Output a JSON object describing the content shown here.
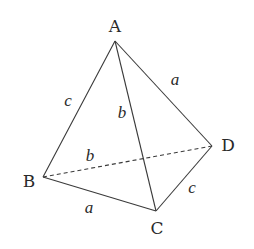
{
  "diagram": {
    "type": "tetrahedron",
    "vertices": {
      "A": {
        "label": "A",
        "x": 115,
        "y": 41,
        "lx": 115,
        "ly": 27
      },
      "B": {
        "label": "B",
        "x": 43,
        "y": 177,
        "lx": 29,
        "ly": 182
      },
      "C": {
        "label": "C",
        "x": 156,
        "y": 211,
        "lx": 157,
        "ly": 229
      },
      "D": {
        "label": "D",
        "x": 212,
        "y": 146,
        "lx": 228,
        "ly": 146
      }
    },
    "edges": [
      {
        "from": "A",
        "to": "B",
        "label": "c",
        "lx": 68,
        "ly": 102,
        "hidden": false
      },
      {
        "from": "A",
        "to": "C",
        "label": "b",
        "lx": 122,
        "ly": 114,
        "hidden": false
      },
      {
        "from": "A",
        "to": "D",
        "label": "a",
        "lx": 175,
        "ly": 81,
        "hidden": false
      },
      {
        "from": "B",
        "to": "D",
        "label": "b",
        "lx": 90,
        "ly": 157,
        "hidden": true
      },
      {
        "from": "B",
        "to": "C",
        "label": "a",
        "lx": 89,
        "ly": 209,
        "hidden": false
      },
      {
        "from": "C",
        "to": "D",
        "label": "c",
        "lx": 192,
        "ly": 189,
        "hidden": false
      }
    ],
    "colors": {
      "line": "#3a3a3a",
      "text": "#2a2a2a",
      "background": "#ffffff"
    }
  }
}
